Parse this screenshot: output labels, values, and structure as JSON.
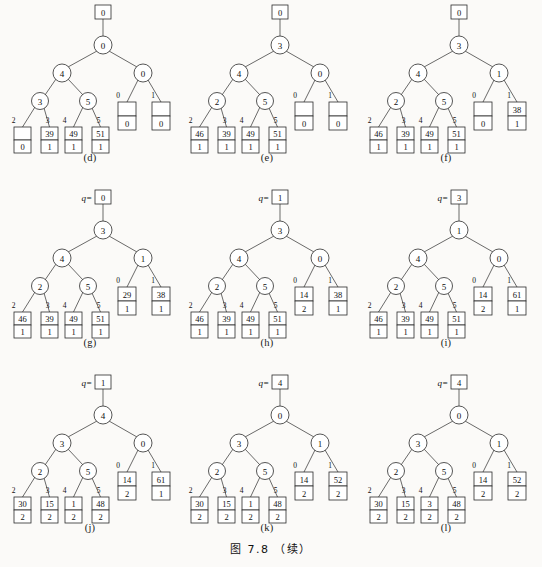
{
  "figure": {
    "caption": "图 7.8 （续）",
    "q_prefix": "q="
  },
  "panels": [
    {
      "id": "d",
      "caption": "(d)",
      "q_label": null,
      "root_box": "0",
      "root_circle": "0",
      "left_circle": "4",
      "right_circle": "0",
      "left_child_l": "3",
      "left_child_r": "5",
      "leaf_edge_labels": [
        "2",
        "3",
        "4",
        "5"
      ],
      "leaves": [
        {
          "top": "",
          "bottom": "0"
        },
        {
          "top": "39",
          "bottom": "1"
        },
        {
          "top": "49",
          "bottom": "1"
        },
        {
          "top": "51",
          "bottom": "1"
        }
      ],
      "right_edge_labels": [
        "0",
        "1"
      ],
      "right_boxes": [
        {
          "top": "",
          "bottom": "0"
        },
        {
          "top": "",
          "bottom": "0"
        }
      ]
    },
    {
      "id": "e",
      "caption": "(e)",
      "q_label": null,
      "root_box": "0",
      "root_circle": "3",
      "left_circle": "4",
      "right_circle": "0",
      "left_child_l": "2",
      "left_child_r": "5",
      "leaf_edge_labels": [
        "2",
        "3",
        "4",
        "5"
      ],
      "leaves": [
        {
          "top": "46",
          "bottom": "1"
        },
        {
          "top": "39",
          "bottom": "1"
        },
        {
          "top": "49",
          "bottom": "1"
        },
        {
          "top": "51",
          "bottom": "1"
        }
      ],
      "right_edge_labels": [
        "0",
        "1"
      ],
      "right_boxes": [
        {
          "top": "",
          "bottom": "0"
        },
        {
          "top": "",
          "bottom": "0"
        }
      ]
    },
    {
      "id": "f",
      "caption": "(f)",
      "q_label": null,
      "root_box": "0",
      "root_circle": "3",
      "left_circle": "4",
      "right_circle": "1",
      "left_child_l": "2",
      "left_child_r": "5",
      "leaf_edge_labels": [
        "2",
        "3",
        "4",
        "5"
      ],
      "leaves": [
        {
          "top": "46",
          "bottom": "1"
        },
        {
          "top": "39",
          "bottom": "1"
        },
        {
          "top": "49",
          "bottom": "1"
        },
        {
          "top": "51",
          "bottom": "1"
        }
      ],
      "right_edge_labels": [
        "0",
        "1"
      ],
      "right_boxes": [
        {
          "top": "",
          "bottom": "0"
        },
        {
          "top": "38",
          "bottom": "1"
        }
      ]
    },
    {
      "id": "g",
      "caption": "(g)",
      "q_label": "0",
      "root_box": "0",
      "root_circle": "3",
      "left_circle": "4",
      "right_circle": "1",
      "left_child_l": "2",
      "left_child_r": "5",
      "leaf_edge_labels": [
        "2",
        "3",
        "4",
        "5"
      ],
      "leaves": [
        {
          "top": "46",
          "bottom": "1"
        },
        {
          "top": "39",
          "bottom": "1"
        },
        {
          "top": "49",
          "bottom": "1"
        },
        {
          "top": "51",
          "bottom": "1"
        }
      ],
      "right_edge_labels": [
        "0",
        "1"
      ],
      "right_boxes": [
        {
          "top": "29",
          "bottom": "1"
        },
        {
          "top": "38",
          "bottom": "1"
        }
      ]
    },
    {
      "id": "h",
      "caption": "(h)",
      "q_label": "1",
      "root_box": "1",
      "root_circle": "3",
      "left_circle": "4",
      "right_circle": "0",
      "left_child_l": "2",
      "left_child_r": "5",
      "leaf_edge_labels": [
        "2",
        "3",
        "4",
        "5"
      ],
      "leaves": [
        {
          "top": "46",
          "bottom": "1"
        },
        {
          "top": "39",
          "bottom": "1"
        },
        {
          "top": "49",
          "bottom": "1"
        },
        {
          "top": "51",
          "bottom": "1"
        }
      ],
      "right_edge_labels": [
        "0",
        "1"
      ],
      "right_boxes": [
        {
          "top": "14",
          "bottom": "2"
        },
        {
          "top": "38",
          "bottom": "1"
        }
      ]
    },
    {
      "id": "i",
      "caption": "(i)",
      "q_label": "3",
      "root_box": "3",
      "root_circle": "1",
      "left_circle": "4",
      "right_circle": "0",
      "left_child_l": "2",
      "left_child_r": "5",
      "leaf_edge_labels": [
        "2",
        "3",
        "4",
        "5"
      ],
      "leaves": [
        {
          "top": "46",
          "bottom": "1"
        },
        {
          "top": "39",
          "bottom": "1"
        },
        {
          "top": "49",
          "bottom": "1"
        },
        {
          "top": "51",
          "bottom": "1"
        }
      ],
      "right_edge_labels": [
        "0",
        "1"
      ],
      "right_boxes": [
        {
          "top": "14",
          "bottom": "2"
        },
        {
          "top": "61",
          "bottom": "1"
        }
      ]
    },
    {
      "id": "j",
      "caption": "(j)",
      "q_label": "1",
      "root_box": "1",
      "root_circle": "4",
      "left_circle": "3",
      "right_circle": "0",
      "left_child_l": "2",
      "left_child_r": "5",
      "leaf_edge_labels": [
        "2",
        "3",
        "4",
        "5"
      ],
      "leaves": [
        {
          "top": "30",
          "bottom": "2"
        },
        {
          "top": "15",
          "bottom": "2"
        },
        {
          "top": "1",
          "bottom": "2"
        },
        {
          "top": "48",
          "bottom": "2"
        }
      ],
      "right_edge_labels": [
        "0",
        "1"
      ],
      "right_boxes": [
        {
          "top": "14",
          "bottom": "2"
        },
        {
          "top": "61",
          "bottom": "1"
        }
      ]
    },
    {
      "id": "k",
      "caption": "(k)",
      "q_label": "4",
      "root_box": "4",
      "root_circle": "0",
      "left_circle": "3",
      "right_circle": "1",
      "left_child_l": "2",
      "left_child_r": "5",
      "leaf_edge_labels": [
        "2",
        "3",
        "4",
        "5"
      ],
      "leaves": [
        {
          "top": "30",
          "bottom": "2"
        },
        {
          "top": "15",
          "bottom": "2"
        },
        {
          "top": "1",
          "bottom": "2"
        },
        {
          "top": "48",
          "bottom": "2"
        }
      ],
      "right_edge_labels": [
        "0",
        "1"
      ],
      "right_boxes": [
        {
          "top": "14",
          "bottom": "2"
        },
        {
          "top": "52",
          "bottom": "2"
        }
      ]
    },
    {
      "id": "l",
      "caption": "(l)",
      "q_label": "4",
      "root_box": "4",
      "root_circle": "0",
      "left_circle": "3",
      "right_circle": "1",
      "left_child_l": "2",
      "left_child_r": "5",
      "leaf_edge_labels": [
        "2",
        "3",
        "4",
        "5"
      ],
      "leaves": [
        {
          "top": "30",
          "bottom": "2"
        },
        {
          "top": "15",
          "bottom": "2"
        },
        {
          "top": "3",
          "bottom": "2"
        },
        {
          "top": "48",
          "bottom": "2"
        }
      ],
      "right_edge_labels": [
        "0",
        "1"
      ],
      "right_boxes": [
        {
          "top": "14",
          "bottom": "2"
        },
        {
          "top": "52",
          "bottom": "2"
        }
      ]
    }
  ]
}
